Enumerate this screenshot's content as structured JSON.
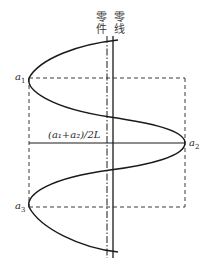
{
  "diagram": {
    "type": "deviation-distribution-diagram",
    "labels": {
      "part_line": "零件",
      "zero_line": "零线",
      "a1": "a",
      "a1_sub": "1",
      "a2": "a",
      "a2_sub": "2",
      "a3": "a",
      "a3_sub": "3",
      "mean_formula": "(a₁+a₂)/2L"
    },
    "colors": {
      "stroke": "#1a1a1a",
      "dashed": "#3a3a3a",
      "background": "#ffffff"
    },
    "elements": [
      {
        "name": "part-line",
        "style": "dash-dot",
        "orientation": "vertical"
      },
      {
        "name": "zero-line",
        "style": "solid",
        "orientation": "vertical"
      },
      {
        "name": "a1-line",
        "style": "dashed",
        "orientation": "horizontal"
      },
      {
        "name": "a3-line",
        "style": "dashed",
        "orientation": "horizontal"
      },
      {
        "name": "mean-line",
        "style": "solid",
        "orientation": "horizontal"
      },
      {
        "name": "left-boundary",
        "style": "dashed",
        "orientation": "vertical"
      },
      {
        "name": "right-boundary",
        "style": "dashed",
        "orientation": "vertical"
      },
      {
        "name": "deviation-curve",
        "style": "solid",
        "shape": "sinusoidal"
      }
    ]
  }
}
